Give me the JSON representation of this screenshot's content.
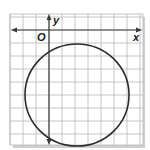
{
  "diagram": {
    "type": "coordinate-plane-circle",
    "labels": {
      "x_axis": "x",
      "y_axis": "y",
      "origin": "O"
    },
    "grid": {
      "x_min": -3,
      "x_max": 7,
      "y_min": -9,
      "y_max": 1,
      "unit": 1
    },
    "circle": {
      "center": [
        2,
        -5
      ],
      "radius": 4
    },
    "colors": {
      "grid_line": "#b8b8b8",
      "axis": "#3a3a3a",
      "curve": "#2b2b2b",
      "shadow": "#bdbdbd",
      "background": "#ffffff"
    }
  }
}
